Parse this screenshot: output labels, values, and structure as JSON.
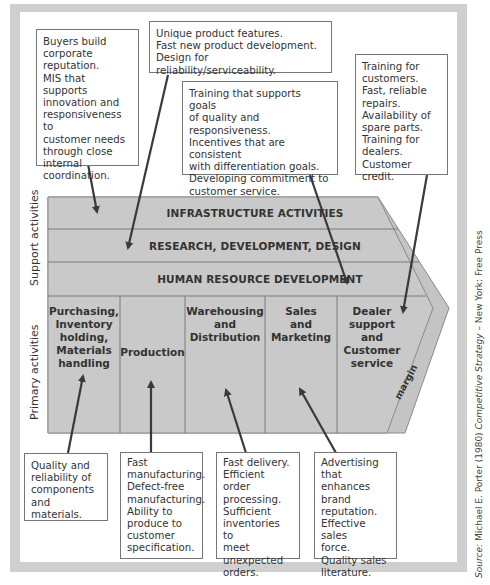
{
  "diagram": {
    "support_label": "Support activities",
    "primary_label": "Primary activities",
    "margin_label": "margin",
    "support_activities": [
      {
        "label": "INFRASTRUCTURE ACTIVITIES"
      },
      {
        "label": "RESEARCH, DEVELOPMENT, DESIGN"
      },
      {
        "label": "HUMAN RESOURCE DEVELOPMENT"
      }
    ],
    "primary_activities": [
      {
        "label": "Purchasing,\nInventory\nholding,\nMaterials\nhandling"
      },
      {
        "label": "Production"
      },
      {
        "label": "Warehousing\nand\nDistribution"
      },
      {
        "label": "Sales\nand\nMarketing"
      },
      {
        "label": "Dealer\nsupport\nand\nCustomer\nservice"
      }
    ],
    "top_notes": [
      {
        "target": "Infrastructure activities",
        "text": "Buyers build\ncorporate\nreputation.\nMIS that supports\ninnovation and\nresponsiveness to\ncustomer needs\nthrough close\ninternal\ncoordination."
      },
      {
        "target": "Research, development, design",
        "text": "Unique product features.\nFast new product development.\nDesign for reliability/serviceability."
      },
      {
        "target": "Human resource development",
        "text": "Training that supports goals\nof quality and\nresponsiveness.\nIncentives that are consistent\nwith differentiation goals.\nDeveloping commitment to\ncustomer service."
      },
      {
        "target": "Dealer support and Customer service",
        "text": "Training for\ncustomers.\nFast, reliable\nrepairs.\nAvailability of\nspare parts.\nTraining for\ndealers.\nCustomer credit."
      }
    ],
    "bottom_notes": [
      {
        "target": "Purchasing, Inventory holding, Materials handling",
        "text": "Quality and\nreliability of\ncomponents\nand materials."
      },
      {
        "target": "Production",
        "text": "Fast\nmanufacturing.\nDefect-free\nmanufacturing.\nAbility to\nproduce to\ncustomer\nspecification."
      },
      {
        "target": "Warehousing and Distribution",
        "text": "Fast delivery.\nEfficient order\nprocessing.\nSufficient\ninventories to\nmeet\nunexpected\norders."
      },
      {
        "target": "Sales and Marketing",
        "text": "Advertising\nthat enhances\nbrand\nreputation.\nEffective sales\nforce.\nQuality sales\nliterature."
      }
    ],
    "source": {
      "prefix": "Source:",
      "author": " Michael E. Porter (1980) ",
      "book": "Competitive Strategy",
      "suffix": " – New York: Free Press"
    },
    "colors": {
      "frame": "#cfcfcf",
      "chain_fill": "#c8c8c8",
      "margin_fill": "#c4c4c4",
      "lines": "#7a7a7a",
      "arrow": "#3a3a3a"
    }
  }
}
